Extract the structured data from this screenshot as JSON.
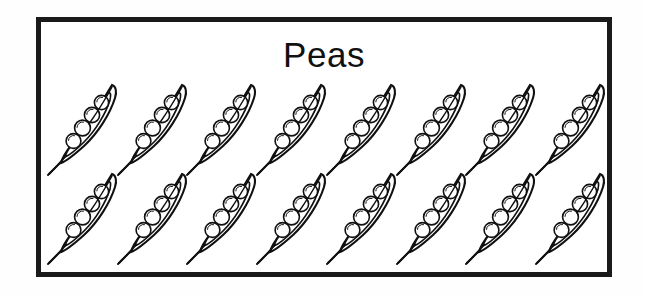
{
  "illustration": {
    "title": "Peas",
    "subject": "pea-pods",
    "style": "black-and-white line-art clip art",
    "frame": {
      "border_color": "#1a1a1a",
      "background_color": "#ffffff",
      "border_width_px": 5
    },
    "colors": {
      "outline": "#111111",
      "fill": "#ffffff",
      "page_background": "#fefefe"
    },
    "layout": {
      "rows": 2,
      "pods_per_row": 8,
      "total_pods": 16,
      "peas_per_pod": 4,
      "total_peas": 64,
      "pod_orientation": "diagonal, tip up-right, stem tail down-left"
    },
    "rows": [
      {
        "row_label": "top-row",
        "pods": [
          {
            "label": "pea-pod-1",
            "peas": 4
          },
          {
            "label": "pea-pod-2",
            "peas": 4
          },
          {
            "label": "pea-pod-3",
            "peas": 4
          },
          {
            "label": "pea-pod-4",
            "peas": 4
          },
          {
            "label": "pea-pod-5",
            "peas": 4
          },
          {
            "label": "pea-pod-6",
            "peas": 4
          },
          {
            "label": "pea-pod-7",
            "peas": 4
          },
          {
            "label": "pea-pod-8",
            "peas": 4
          }
        ]
      },
      {
        "row_label": "bottom-row",
        "pods": [
          {
            "label": "pea-pod-9",
            "peas": 4
          },
          {
            "label": "pea-pod-10",
            "peas": 4
          },
          {
            "label": "pea-pod-11",
            "peas": 4
          },
          {
            "label": "pea-pod-12",
            "peas": 4
          },
          {
            "label": "pea-pod-13",
            "peas": 4
          },
          {
            "label": "pea-pod-14",
            "peas": 4
          },
          {
            "label": "pea-pod-15",
            "peas": 4
          },
          {
            "label": "pea-pod-16",
            "peas": 4
          }
        ]
      }
    ]
  }
}
